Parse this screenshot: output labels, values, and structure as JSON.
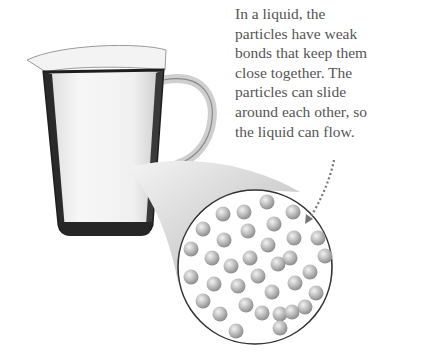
{
  "figure": {
    "caption_lines": [
      "In a liquid, the",
      "particles have weak",
      "bonds that keep them",
      "close together. The",
      "particles can slide",
      "around each other, so",
      "the liquid can flow."
    ],
    "illustration": {
      "jug": "glass jug filled with white liquid",
      "magnifier": "zoomed circular view of closely packed particles",
      "particle_count": 38,
      "arrow": "dotted arrow from caption to particles"
    },
    "colors": {
      "text": "#555555",
      "particle": "#b8b8b8",
      "outline": "#333333",
      "jug_dark": "#1e1e1e"
    }
  }
}
